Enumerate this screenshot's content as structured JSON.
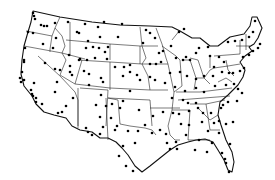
{
  "map": {
    "title": "",
    "region": "contiguous-united-states",
    "style": {
      "background": "#ffffff",
      "line_color": "#111111",
      "dot_color": "#000000"
    },
    "dots": [
      [
        33,
        13
      ],
      [
        34,
        16
      ],
      [
        35,
        19
      ],
      [
        41,
        25
      ],
      [
        44,
        26
      ],
      [
        47,
        26
      ],
      [
        55,
        23
      ],
      [
        28,
        32
      ],
      [
        33,
        33
      ],
      [
        25,
        48
      ],
      [
        43,
        44
      ],
      [
        56,
        38
      ],
      [
        53,
        48
      ],
      [
        68,
        22
      ],
      [
        77,
        32
      ],
      [
        85,
        24
      ],
      [
        98,
        27
      ],
      [
        100,
        37
      ],
      [
        88,
        41
      ],
      [
        79,
        33
      ],
      [
        69,
        55
      ],
      [
        104,
        22
      ],
      [
        122,
        24
      ],
      [
        118,
        37
      ],
      [
        86,
        48
      ],
      [
        93,
        47
      ],
      [
        99,
        48
      ],
      [
        108,
        47
      ],
      [
        105,
        52
      ],
      [
        80,
        59
      ],
      [
        87,
        60
      ],
      [
        95,
        58
      ],
      [
        107,
        59
      ],
      [
        79,
        60
      ],
      [
        24,
        60
      ],
      [
        24,
        62
      ],
      [
        45,
        63
      ],
      [
        22,
        72
      ],
      [
        20,
        78
      ],
      [
        21,
        82
      ],
      [
        24,
        80
      ],
      [
        34,
        83
      ],
      [
        31,
        90
      ],
      [
        32,
        94
      ],
      [
        33,
        96
      ],
      [
        36,
        98
      ],
      [
        55,
        69
      ],
      [
        57,
        82
      ],
      [
        60,
        70
      ],
      [
        55,
        92
      ],
      [
        70,
        66
      ],
      [
        70,
        72
      ],
      [
        72,
        75
      ],
      [
        84,
        71
      ],
      [
        89,
        74
      ],
      [
        101,
        78
      ],
      [
        103,
        82
      ],
      [
        101,
        95
      ],
      [
        115,
        67
      ],
      [
        124,
        67
      ],
      [
        123,
        76
      ],
      [
        130,
        65
      ],
      [
        130,
        72
      ],
      [
        130,
        91
      ],
      [
        137,
        75
      ],
      [
        140,
        80
      ],
      [
        150,
        77
      ],
      [
        155,
        80
      ],
      [
        146,
        30
      ],
      [
        150,
        33
      ],
      [
        143,
        43
      ],
      [
        155,
        38
      ],
      [
        159,
        53
      ],
      [
        150,
        64
      ],
      [
        156,
        64
      ],
      [
        161,
        62
      ],
      [
        163,
        51
      ],
      [
        171,
        46
      ],
      [
        179,
        32
      ],
      [
        184,
        29
      ],
      [
        176,
        58
      ],
      [
        183,
        60
      ],
      [
        186,
        57
      ],
      [
        190,
        60
      ],
      [
        196,
        53
      ],
      [
        199,
        48
      ],
      [
        208,
        47
      ],
      [
        210,
        56
      ],
      [
        219,
        57
      ],
      [
        214,
        67
      ],
      [
        224,
        62
      ],
      [
        228,
        42
      ],
      [
        235,
        41
      ],
      [
        242,
        40
      ],
      [
        249,
        37
      ],
      [
        253,
        32
      ],
      [
        255,
        21
      ],
      [
        243,
        57
      ],
      [
        249,
        55
      ],
      [
        253,
        51
      ],
      [
        258,
        48
      ],
      [
        260,
        44
      ],
      [
        170,
        73
      ],
      [
        180,
        72
      ],
      [
        187,
        76
      ],
      [
        196,
        79
      ],
      [
        204,
        76
      ],
      [
        213,
        76
      ],
      [
        222,
        72
      ],
      [
        229,
        73
      ],
      [
        233,
        73
      ],
      [
        240,
        71
      ],
      [
        244,
        68
      ],
      [
        165,
        83
      ],
      [
        175,
        87
      ],
      [
        185,
        91
      ],
      [
        196,
        88
      ],
      [
        204,
        92
      ],
      [
        215,
        86
      ],
      [
        226,
        85
      ],
      [
        234,
        84
      ],
      [
        238,
        89
      ],
      [
        242,
        93
      ],
      [
        112,
        104
      ],
      [
        120,
        108
      ],
      [
        123,
        101
      ],
      [
        139,
        110
      ],
      [
        153,
        116
      ],
      [
        163,
        112
      ],
      [
        173,
        113
      ],
      [
        179,
        114
      ],
      [
        189,
        111
      ],
      [
        198,
        108
      ],
      [
        203,
        113
      ],
      [
        211,
        113
      ],
      [
        221,
        108
      ],
      [
        223,
        105
      ],
      [
        228,
        102
      ],
      [
        237,
        101
      ],
      [
        172,
        98
      ],
      [
        183,
        100
      ],
      [
        188,
        103
      ],
      [
        196,
        103
      ],
      [
        181,
        124
      ],
      [
        189,
        125
      ],
      [
        202,
        122
      ],
      [
        214,
        123
      ],
      [
        219,
        121
      ],
      [
        226,
        124
      ],
      [
        233,
        122
      ],
      [
        138,
        131
      ],
      [
        145,
        125
      ],
      [
        152,
        133
      ],
      [
        160,
        130
      ],
      [
        167,
        143
      ],
      [
        170,
        149
      ],
      [
        166,
        134
      ],
      [
        176,
        142
      ],
      [
        177,
        149
      ],
      [
        219,
        133
      ],
      [
        230,
        144
      ],
      [
        222,
        153
      ],
      [
        225,
        159
      ],
      [
        226,
        163
      ],
      [
        229,
        172
      ],
      [
        100,
        117
      ],
      [
        103,
        127
      ],
      [
        111,
        118
      ],
      [
        128,
        131
      ],
      [
        135,
        143
      ],
      [
        123,
        146
      ],
      [
        119,
        156
      ],
      [
        126,
        166
      ],
      [
        133,
        171
      ],
      [
        89,
        85
      ],
      [
        96,
        105
      ],
      [
        106,
        106
      ],
      [
        117,
        126
      ],
      [
        115,
        130
      ],
      [
        66,
        106
      ],
      [
        62,
        112
      ],
      [
        73,
        98
      ],
      [
        58,
        113
      ],
      [
        42,
        104
      ],
      [
        36,
        102
      ],
      [
        86,
        128
      ],
      [
        88,
        132
      ],
      [
        92,
        135
      ],
      [
        100,
        134
      ],
      [
        208,
        131
      ],
      [
        212,
        143
      ],
      [
        195,
        150
      ],
      [
        207,
        152
      ],
      [
        199,
        140
      ],
      [
        186,
        135
      ]
    ]
  }
}
